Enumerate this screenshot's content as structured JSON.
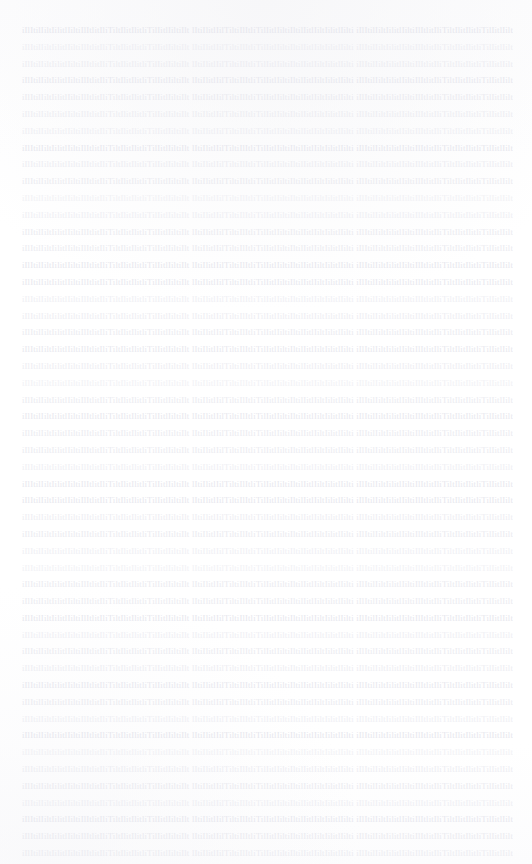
{
  "document": {
    "kind": "scanned-text-page",
    "legibility": "illegible",
    "legibility_note": "Body text is faded to near-white; no individual characters are resolvable at any zoom level. Only the horizontal striation of justified text rows is visible.",
    "page_width_px": 532,
    "page_height_px": 864,
    "background_color": "#ffffff",
    "text_color": "#e9e9ef",
    "header_text": "",
    "footer_text": "",
    "page_number": "",
    "title": "",
    "layout": {
      "columns": 1,
      "alignment": "justified",
      "margin_left_px": 22,
      "margin_right_px": 19,
      "margin_top_px": 22,
      "margin_bottom_px": 0,
      "text_block_width_px": 491,
      "line_height_px": 16.8,
      "first_baseline_y_px": 31,
      "last_baseline_y_px": 855,
      "line_count": 50,
      "paragraph_indent_px": 0,
      "headings_present": false,
      "emphasis_present": false
    },
    "lines": [
      {
        "index": 1,
        "text": ""
      },
      {
        "index": 2,
        "text": ""
      },
      {
        "index": 3,
        "text": ""
      },
      {
        "index": 4,
        "text": ""
      },
      {
        "index": 5,
        "text": ""
      },
      {
        "index": 6,
        "text": ""
      },
      {
        "index": 7,
        "text": ""
      },
      {
        "index": 8,
        "text": ""
      },
      {
        "index": 9,
        "text": ""
      },
      {
        "index": 10,
        "text": ""
      },
      {
        "index": 11,
        "text": ""
      },
      {
        "index": 12,
        "text": ""
      },
      {
        "index": 13,
        "text": ""
      },
      {
        "index": 14,
        "text": ""
      },
      {
        "index": 15,
        "text": ""
      },
      {
        "index": 16,
        "text": ""
      },
      {
        "index": 17,
        "text": ""
      },
      {
        "index": 18,
        "text": ""
      },
      {
        "index": 19,
        "text": ""
      },
      {
        "index": 20,
        "text": ""
      },
      {
        "index": 21,
        "text": ""
      },
      {
        "index": 22,
        "text": ""
      },
      {
        "index": 23,
        "text": ""
      },
      {
        "index": 24,
        "text": ""
      },
      {
        "index": 25,
        "text": ""
      },
      {
        "index": 26,
        "text": ""
      },
      {
        "index": 27,
        "text": ""
      },
      {
        "index": 28,
        "text": ""
      },
      {
        "index": 29,
        "text": ""
      },
      {
        "index": 30,
        "text": ""
      },
      {
        "index": 31,
        "text": ""
      },
      {
        "index": 32,
        "text": ""
      },
      {
        "index": 33,
        "text": ""
      },
      {
        "index": 34,
        "text": ""
      },
      {
        "index": 35,
        "text": ""
      },
      {
        "index": 36,
        "text": ""
      },
      {
        "index": 37,
        "text": ""
      },
      {
        "index": 38,
        "text": ""
      },
      {
        "index": 39,
        "text": ""
      },
      {
        "index": 40,
        "text": ""
      },
      {
        "index": 41,
        "text": ""
      },
      {
        "index": 42,
        "text": ""
      },
      {
        "index": 43,
        "text": ""
      },
      {
        "index": 44,
        "text": ""
      },
      {
        "index": 45,
        "text": ""
      },
      {
        "index": 46,
        "text": ""
      },
      {
        "index": 47,
        "text": ""
      },
      {
        "index": 48,
        "text": ""
      },
      {
        "index": 49,
        "text": ""
      },
      {
        "index": 50,
        "text": ""
      }
    ]
  }
}
